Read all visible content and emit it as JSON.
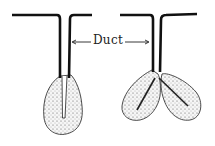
{
  "diagram": {
    "type": "gland-structure-comparison",
    "label": "Duct",
    "glands": [
      {
        "name": "simple-gland",
        "lobes": 1,
        "description": "unbranched duct with single secretory sac"
      },
      {
        "name": "compound-gland",
        "lobes": 2,
        "description": "duct branching into two secretory lobes"
      }
    ],
    "colors": {
      "outline": "#111111",
      "stipple": "#555555",
      "fill": "#f4f4f4"
    }
  }
}
